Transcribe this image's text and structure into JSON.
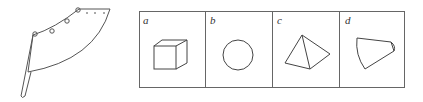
{
  "figure": {
    "left_object": "curved-tapered-horn",
    "panels": [
      {
        "label": "a",
        "shape": "cube"
      },
      {
        "label": "b",
        "shape": "circle"
      },
      {
        "label": "c",
        "shape": "pyramid"
      },
      {
        "label": "d",
        "shape": "truncated-cone-section"
      }
    ],
    "stroke_color": "#555555"
  }
}
